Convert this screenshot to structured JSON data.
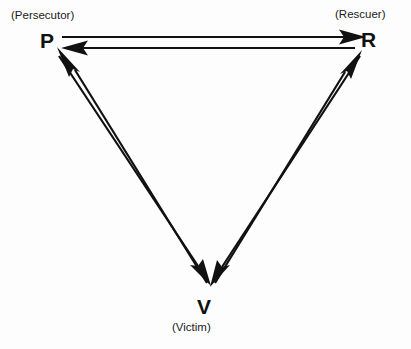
{
  "diagram": {
    "type": "triangle-cycle-diagram",
    "background_color": "#fdfdfd",
    "stroke_color": "#111111",
    "nodes": [
      {
        "id": "persecutor",
        "letter": "P",
        "role_label": "(Persecutor)",
        "position": "top-left"
      },
      {
        "id": "rescuer",
        "letter": "R",
        "role_label": "(Rescuer)",
        "position": "top-right"
      },
      {
        "id": "victim",
        "letter": "V",
        "role_label": "(Victim)",
        "position": "bottom-center"
      }
    ],
    "edges": [
      {
        "id": "p-to-r",
        "from": "P",
        "to": "R",
        "side": "top",
        "direction": "right"
      },
      {
        "id": "r-to-p",
        "from": "R",
        "to": "P",
        "side": "top",
        "direction": "left"
      },
      {
        "id": "p-to-v",
        "from": "P",
        "to": "V",
        "side": "left",
        "direction": "down"
      },
      {
        "id": "v-to-p",
        "from": "V",
        "to": "P",
        "side": "left",
        "direction": "up"
      },
      {
        "id": "r-to-v",
        "from": "R",
        "to": "V",
        "side": "right",
        "direction": "down"
      },
      {
        "id": "v-to-r",
        "from": "V",
        "to": "R",
        "side": "right",
        "direction": "up"
      }
    ]
  }
}
